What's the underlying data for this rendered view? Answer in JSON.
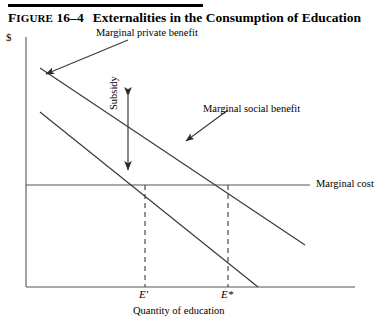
{
  "header": {
    "figure_number": "FIGURE 16–4",
    "figure_number_prefix": "F",
    "figure_number_rest": "IGURE",
    "figure_number_value": " 16–4",
    "title": "Externalities in the Consumption of Education"
  },
  "axes": {
    "y_label": "$",
    "x_title": "Quantity of education",
    "x_ticks": [
      {
        "label": "E′",
        "name": "tick-e-prime"
      },
      {
        "label": "E*",
        "name": "tick-e-star"
      }
    ]
  },
  "annotations": {
    "marginal_private_benefit": "Marginal private benefit",
    "marginal_social_benefit": "Marginal social benefit",
    "marginal_cost": "Marginal cost",
    "subsidy": "Subsidy"
  },
  "colors": {
    "line": "#2b2b2b",
    "axis": "#555555",
    "text": "#000000",
    "rule": "#000000"
  },
  "chart_data": {
    "type": "line",
    "title": "Externalities in the Consumption of Education",
    "xlabel": "Quantity of education",
    "ylabel": "$",
    "grid": false,
    "legend": "none",
    "axis_pixel_frame": {
      "x0": 26,
      "y0": 287,
      "x1": 355,
      "y1": 37
    },
    "series": [
      {
        "name": "Marginal social benefit",
        "type": "line",
        "points": [
          [
            40,
            68
          ],
          [
            305,
            245
          ]
        ],
        "note": "upper downward-sloping curve"
      },
      {
        "name": "Marginal private benefit",
        "type": "line",
        "points": [
          [
            40,
            112
          ],
          [
            258,
            287
          ]
        ],
        "note": "lower downward-sloping curve"
      },
      {
        "name": "Marginal cost",
        "type": "line",
        "points": [
          [
            26,
            185
          ],
          [
            310,
            185
          ]
        ],
        "note": "horizontal constant marginal cost line"
      }
    ],
    "markers": [
      {
        "name": "E′",
        "x_pixel": 145,
        "y_pixel": 185,
        "note": "private equilibrium: MPB = MC"
      },
      {
        "name": "E*",
        "x_pixel": 228,
        "y_pixel": 185,
        "note": "social optimum: MSB = MC"
      }
    ],
    "annotations": [
      {
        "text": "Subsidy",
        "type": "double-arrow",
        "x_pixel": 128,
        "y_from": 88,
        "y_to": 178,
        "note": "vertical gap between MPB and MSB curves"
      },
      {
        "text": "Marginal private benefit",
        "type": "leader-arrow",
        "points_to": [
          45,
          72
        ]
      },
      {
        "text": "Marginal social benefit",
        "type": "leader-arrow",
        "points_to": [
          188,
          140
        ]
      }
    ]
  }
}
